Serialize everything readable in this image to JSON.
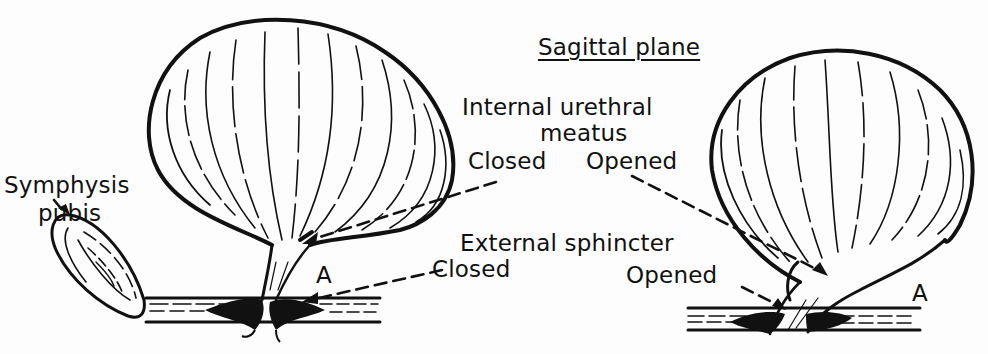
{
  "diagram": {
    "title": "Sagittal plane",
    "colors": {
      "ink": "#111111",
      "paper": "#fdfdfd"
    },
    "labels": {
      "symphysis_line1": "Symphysis",
      "symphysis_line2": "pubis",
      "internal_line1": "Internal urethral",
      "internal_line2": "meatus",
      "internal_closed": "Closed",
      "internal_opened": "Opened",
      "external": "External sphincter",
      "external_closed": "Closed",
      "external_opened": "Opened",
      "marker_left": "A",
      "marker_right": "A"
    },
    "panels": [
      {
        "name": "left",
        "state": "Closed",
        "structures": [
          "symphysis pubis",
          "bladder",
          "internal urethral meatus",
          "external sphincter",
          "urethra"
        ]
      },
      {
        "name": "right",
        "state": "Opened",
        "structures": [
          "bladder",
          "internal urethral meatus",
          "external sphincter",
          "urethra"
        ]
      }
    ]
  }
}
